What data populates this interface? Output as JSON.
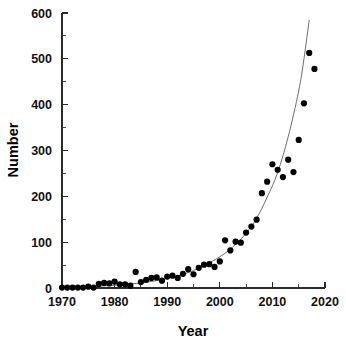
{
  "chart_data": {
    "type": "scatter",
    "title": "",
    "subtitle": "",
    "xlabel": "Year",
    "ylabel": "Number",
    "xlim": [
      1970,
      2020
    ],
    "ylim": [
      0,
      600
    ],
    "grid": false,
    "legend": false,
    "x_ticks_major": [
      1970,
      1980,
      1990,
      2000,
      2010,
      2020
    ],
    "x_ticks_minor": [
      1975,
      1985,
      1995,
      2005,
      2015
    ],
    "y_ticks_major": [
      0,
      100,
      200,
      300,
      400,
      500,
      600
    ],
    "y_ticks_minor": [
      50,
      150,
      250,
      350,
      450,
      550
    ],
    "x_tick_labels": [
      "1970",
      "1980",
      "1990",
      "2000",
      "2010",
      "2020"
    ],
    "y_tick_labels": [
      "0",
      "100",
      "200",
      "300",
      "400",
      "500",
      "600"
    ],
    "marker": "filled-circle",
    "marker_color": "#000000",
    "fit_curve_color": "#6e6e6e",
    "axis_color": "#2b2b2b",
    "series": [
      {
        "name": "Number",
        "x": [
          1970,
          1971,
          1972,
          1973,
          1974,
          1975,
          1976,
          1977,
          1978,
          1979,
          1980,
          1981,
          1982,
          1983,
          1984,
          1985,
          1986,
          1987,
          1988,
          1989,
          1990,
          1991,
          1992,
          1993,
          1994,
          1995,
          1996,
          1997,
          1998,
          1999,
          2000,
          2001,
          2002,
          2003,
          2004,
          2005,
          2006,
          2007,
          2008,
          2009,
          2010,
          2011,
          2012,
          2013,
          2014,
          2015,
          2016,
          2017,
          2018
        ],
        "y": [
          1,
          1,
          1,
          1,
          1,
          3,
          1,
          9,
          11,
          10,
          14,
          8,
          8,
          5,
          35,
          13,
          18,
          22,
          23,
          16,
          25,
          27,
          22,
          31,
          41,
          30,
          44,
          51,
          52,
          46,
          58,
          104,
          82,
          101,
          99,
          121,
          134,
          149,
          207,
          232,
          270,
          258,
          242,
          280,
          253,
          323,
          403,
          513,
          478
        ]
      }
    ],
    "fit_curve": {
      "name": "exponential fit",
      "x": [
        1970,
        1975,
        1980,
        1985,
        1990,
        1995,
        2000,
        2003,
        2005,
        2007,
        2009,
        2011,
        2013,
        2015,
        2016,
        2017
      ],
      "y": [
        1,
        3,
        6,
        11,
        21,
        38,
        68,
        95,
        120,
        152,
        198,
        252,
        330,
        430,
        500,
        585
      ]
    }
  },
  "axis": {
    "y_title": "Number",
    "x_title": "Year"
  }
}
